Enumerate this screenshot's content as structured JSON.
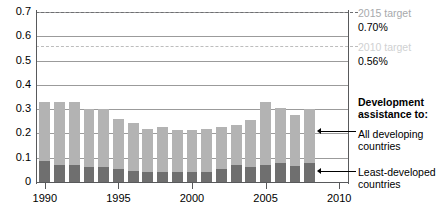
{
  "chart_data": {
    "type": "bar",
    "stacked": true,
    "title": "",
    "subtitle": "",
    "xlabel": "",
    "ylabel": "",
    "ylim": [
      0,
      0.7
    ],
    "xlim": [
      1989.4,
      2010.6
    ],
    "grid": true,
    "legend_position": "right",
    "ytick_labels": [
      "0",
      "0.1",
      "0.2",
      "0.3",
      "0.4",
      "0.5",
      "0.6",
      "0.7"
    ],
    "ytick_values": [
      0,
      0.1,
      0.2,
      0.3,
      0.4,
      0.5,
      0.6,
      0.7
    ],
    "xtick_labels": [
      "1990",
      "1995",
      "2000",
      "2005",
      "2010"
    ],
    "xtick_values": [
      1990,
      1995,
      2000,
      2005,
      2010
    ],
    "categories": [
      1990,
      1991,
      1992,
      1993,
      1994,
      1995,
      1996,
      1997,
      1998,
      1999,
      2000,
      2001,
      2002,
      2003,
      2004,
      2005,
      2006,
      2007,
      2008
    ],
    "series": [
      {
        "name": "All developing countries",
        "color": "#b3b3b3",
        "note": "total height of each bar",
        "values": [
          0.33,
          0.33,
          0.33,
          0.3,
          0.3,
          0.26,
          0.245,
          0.22,
          0.225,
          0.215,
          0.215,
          0.217,
          0.225,
          0.235,
          0.255,
          0.33,
          0.305,
          0.275,
          0.3
        ]
      },
      {
        "name": "Least-developed countries",
        "color": "#6f6f6f",
        "note": "dark lower segment of each bar",
        "values": [
          0.085,
          0.072,
          0.072,
          0.063,
          0.062,
          0.055,
          0.045,
          0.043,
          0.043,
          0.043,
          0.042,
          0.043,
          0.054,
          0.07,
          0.061,
          0.069,
          0.077,
          0.068,
          0.078
        ]
      }
    ],
    "reference_lines": [
      {
        "name": "2015 target",
        "value": 0.7,
        "label": "2015 target",
        "value_label": "0.70%",
        "style": "dashed",
        "color": "#6d6e71"
      },
      {
        "name": "2010 target",
        "value": 0.56,
        "label": "2010 target",
        "value_label": "0.56%",
        "style": "dashed",
        "color": "#bdbdbd"
      }
    ],
    "annotations": [
      {
        "name": "legend-heading",
        "text_line1": "Development",
        "text_line2": "assistance to:"
      },
      {
        "name": "legend-all-developing",
        "text_line1": "All developing",
        "text_line2": "countries",
        "points_to": 0.21
      },
      {
        "name": "legend-least-developed",
        "text_line1": "Least-developed",
        "text_line2": "countries",
        "points_to": 0.04
      }
    ]
  },
  "axis": {
    "y_ticks": [
      {
        "label": "0.7",
        "value": 0.7
      },
      {
        "label": "0.6",
        "value": 0.6
      },
      {
        "label": "0.5",
        "value": 0.5
      },
      {
        "label": "0.4",
        "value": 0.4
      },
      {
        "label": "0.3",
        "value": 0.3
      },
      {
        "label": "0.2",
        "value": 0.2
      },
      {
        "label": "0.1",
        "value": 0.1
      },
      {
        "label": "0",
        "value": 0.0
      }
    ],
    "x_ticks": [
      {
        "label": "1990",
        "value": 1990
      },
      {
        "label": "1995",
        "value": 1995
      },
      {
        "label": "2000",
        "value": 2000
      },
      {
        "label": "2005",
        "value": 2005
      },
      {
        "label": "2010",
        "value": 2010
      }
    ]
  },
  "side_panel": {
    "target_2015_label": "2015 target",
    "target_2015_value": "0.70%",
    "target_2010_label": "2010 target",
    "target_2010_value": "0.56%",
    "legend_heading_line1": "Development",
    "legend_heading_line2": "assistance to:",
    "legend_item1_line1": "All developing",
    "legend_item1_line2": "countries",
    "legend_item2_line1": "Least-developed",
    "legend_item2_line2": "countries"
  },
  "colors": {
    "series_all_developing": "#b3b3b3",
    "series_least_developed": "#6f6f6f",
    "gridline": "#9b9b9b",
    "axis": "#58595b",
    "target_2015": "#6d6e71",
    "target_2010": "#bdbdbd",
    "text": "#000000",
    "background": "#ffffff"
  }
}
